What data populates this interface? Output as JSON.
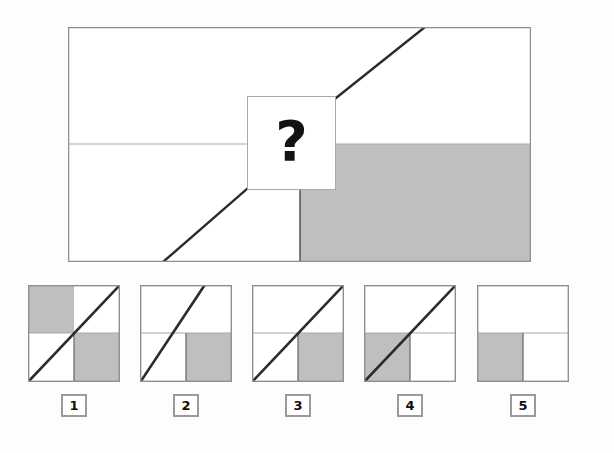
{
  "puzzle": {
    "kind": "visual-analogy-matrix",
    "question_marker": "?",
    "colors": {
      "page_background": "#fdfdfd",
      "panel_fill": "#ffffff",
      "shaded_fill": "#bfbfbf",
      "thin_border": "#a9a9a9",
      "outer_border": "#8f8f8f",
      "diagonal_stroke": "#2b2b2b",
      "label_border": "#9a9a9a",
      "label_text": "#101010"
    },
    "stimulus": {
      "name": "matrix-panel",
      "width": 463,
      "height": 235,
      "horizontal_divider_y": 117,
      "vertical_divider_x": 232,
      "shaded_region": {
        "x": 232,
        "y": 117,
        "width": 231,
        "height": 118,
        "fill": "#bfbfbf"
      },
      "diagonal_segments": [
        {
          "x1": 95,
          "y1": 235,
          "x2": 179,
          "y2": 162
        },
        {
          "x1": 268,
          "y1": 71,
          "x2": 357,
          "y2": 0
        }
      ],
      "occluder": {
        "label": "?",
        "x": 179,
        "y": 69,
        "width": 89,
        "height": 94
      }
    },
    "options": [
      {
        "id": "1",
        "label": "1",
        "name": "option-1",
        "shaded_quadrants": [
          "top-left",
          "bottom-right"
        ],
        "has_diagonal": true,
        "diagonal": {
          "x1": 1,
          "y1": 96,
          "x2": 91,
          "y2": 1
        },
        "horizontal_divider_y": 48,
        "vertical_divider": {
          "x": 46,
          "from_y": 48,
          "to_y": 96
        }
      },
      {
        "id": "2",
        "label": "2",
        "name": "option-2",
        "shaded_quadrants": [
          "bottom-right"
        ],
        "has_diagonal": true,
        "diagonal": {
          "x1": 1,
          "y1": 96,
          "x2": 64,
          "y2": 1
        },
        "horizontal_divider_y": 48,
        "vertical_divider": {
          "x": 46,
          "from_y": 48,
          "to_y": 96
        }
      },
      {
        "id": "3",
        "label": "3",
        "name": "option-3",
        "shaded_quadrants": [
          "bottom-right"
        ],
        "has_diagonal": true,
        "diagonal": {
          "x1": 1,
          "y1": 96,
          "x2": 91,
          "y2": 1
        },
        "horizontal_divider_y": 48,
        "vertical_divider": {
          "x": 46,
          "from_y": 48,
          "to_y": 96
        }
      },
      {
        "id": "4",
        "label": "4",
        "name": "option-4",
        "shaded_quadrants": [
          "bottom-left"
        ],
        "has_diagonal": true,
        "diagonal": {
          "x1": 1,
          "y1": 96,
          "x2": 91,
          "y2": 1
        },
        "horizontal_divider_y": 48,
        "vertical_divider": {
          "x": 46,
          "from_y": 48,
          "to_y": 96
        }
      },
      {
        "id": "5",
        "label": "5",
        "name": "option-5",
        "shaded_quadrants": [
          "bottom-left"
        ],
        "has_diagonal": false,
        "diagonal": null,
        "horizontal_divider_y": 48,
        "vertical_divider": {
          "x": 46,
          "from_y": 48,
          "to_y": 96
        }
      }
    ],
    "option_positions_x": [
      28,
      140,
      252,
      364,
      477
    ],
    "label_positions_x": [
      61,
      173,
      285,
      397,
      510
    ]
  }
}
